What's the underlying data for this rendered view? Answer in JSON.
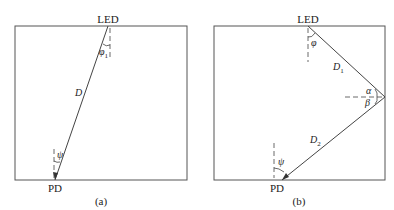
{
  "figure": {
    "panel_a": {
      "caption": "(a)",
      "source_label": "LED",
      "receiver_label": "PD",
      "distance_label": "D",
      "irradiance_angle_label": "φ",
      "irradiance_angle_sub": "1",
      "incidence_angle_label": "ψ"
    },
    "panel_b": {
      "caption": "(b)",
      "source_label": "LED",
      "receiver_label": "PD",
      "distance1_label": "D",
      "distance1_sub": "1",
      "distance2_label": "D",
      "distance2_sub": "2",
      "irradiance_angle_label": "φ",
      "incidence_angle_label": "ψ",
      "reflect_in_angle_label": "α",
      "reflect_out_angle_label": "β"
    }
  },
  "colors": {
    "line": "#444444",
    "text": "#222222"
  }
}
